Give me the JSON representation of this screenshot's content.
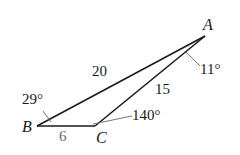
{
  "diagram": {
    "type": "triangle",
    "vertices": [
      {
        "name": "A",
        "x": 205,
        "y": 36
      },
      {
        "name": "B",
        "x": 37,
        "y": 126
      },
      {
        "name": "C",
        "x": 95,
        "y": 126
      }
    ],
    "sides": [
      {
        "between": "AB",
        "label": "20"
      },
      {
        "between": "AC",
        "label": "15"
      },
      {
        "between": "BC",
        "label": "6"
      }
    ],
    "angles": [
      {
        "vertex": "B",
        "label": "29°"
      },
      {
        "vertex": "A",
        "label": "11°"
      },
      {
        "vertex": "C",
        "label": "140°"
      }
    ],
    "colors": {
      "line": "#1a1a1a",
      "leader": "#777777",
      "text": "#1a1a1a",
      "muted_text": "#6a6a6a"
    }
  }
}
